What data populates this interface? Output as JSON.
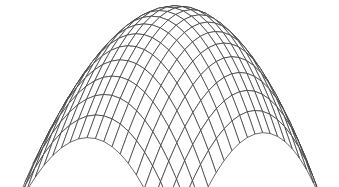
{
  "figure": {
    "description": "3D wireframe mesh of a dome-shaped (paraboloid) surface",
    "surface": {
      "type": "paraboloid",
      "equation": "z = 1 - x^2 - y^2",
      "x_range": [
        -1,
        1
      ],
      "y_range": [
        -1,
        1
      ],
      "grid_divisions": 20
    },
    "projection": {
      "front_corner_px": [
        179,
        158
      ],
      "left_corner_px": [
        12,
        119
      ],
      "right_corner_px": [
        331,
        110
      ],
      "apex_px": [
        175,
        8
      ]
    },
    "style": {
      "background": "#ffffff",
      "line_color": "#3a3a3a",
      "fill_color": "#ffffff"
    }
  }
}
